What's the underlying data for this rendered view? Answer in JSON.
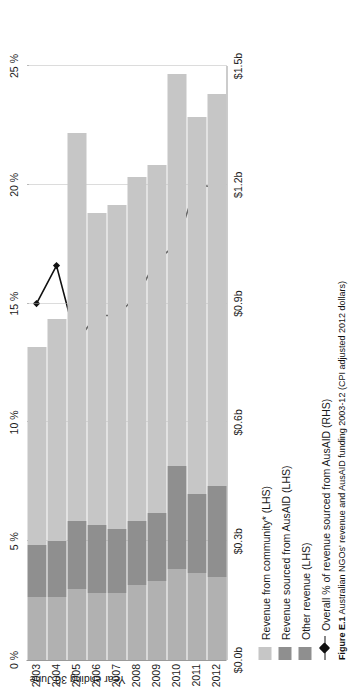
{
  "figure": {
    "caption_label": "Figure E.1",
    "caption_text": "Australian NGOs' revenue and AusAID funding 2003-12 (CPI adjusted 2012 dollars)",
    "x_axis_title": "Year ending 30 June"
  },
  "legend": {
    "items": [
      {
        "key": "community",
        "label": "Revenue from community* (LHS)",
        "marker": "swatch",
        "color": "#c6c6c6"
      },
      {
        "key": "ausaid",
        "label": "Revenue sourced from AusAID (LHS)",
        "marker": "swatch",
        "color": "#8f8f8f"
      },
      {
        "key": "other",
        "label": "Other revenue (LHS)",
        "marker": "swatch",
        "color": "#8f8f8f"
      },
      {
        "key": "pct",
        "label": "Overall % of revenue sourced from AusAID (RHS)",
        "marker": "line-diamond",
        "color": "#111111"
      }
    ]
  },
  "chart_data": {
    "type": "bar",
    "title": "Australian NGOs' revenue and AusAID funding 2003-12 (CPI adjusted 2012 dollars)",
    "xlabel": "Year ending 30 June",
    "ylabel": "",
    "orientation": "vertical-rotated",
    "grid": true,
    "legend_position": "bottom",
    "categories": [
      "2003",
      "2004",
      "2005",
      "2006",
      "2007",
      "2008",
      "2009",
      "2010",
      "2011",
      "2012"
    ],
    "left_axis": {
      "label": "",
      "ticks": [
        "$0.0b",
        "$0.3b",
        "$0.6b",
        "$0.9b",
        "$1.2b",
        "$1.5b"
      ],
      "tick_values": [
        0.0,
        0.3,
        0.6,
        0.9,
        1.2,
        1.5
      ],
      "ylim": [
        0.0,
        1.5
      ],
      "unit": "billion AUD"
    },
    "right_axis": {
      "label": "",
      "ticks": [
        "0 %",
        "5 %",
        "10 %",
        "15 %",
        "20 %",
        "25 %"
      ],
      "tick_values": [
        0,
        5,
        10,
        15,
        20,
        25
      ],
      "ylim": [
        0,
        25
      ],
      "unit": "percent"
    },
    "series": [
      {
        "name": "Other revenue (LHS)",
        "axis": "left",
        "stack": 1,
        "color": "#b1b1b1",
        "values": [
          0.16,
          0.16,
          0.18,
          0.17,
          0.17,
          0.19,
          0.2,
          0.23,
          0.22,
          0.21
        ]
      },
      {
        "name": "Revenue sourced from AusAID (LHS)",
        "axis": "left",
        "stack": 2,
        "color": "#8f8f8f",
        "values": [
          0.13,
          0.14,
          0.17,
          0.17,
          0.16,
          0.16,
          0.17,
          0.26,
          0.2,
          0.23
        ]
      },
      {
        "name": "Revenue from community* (LHS)",
        "axis": "left",
        "stack": 3,
        "color": "#c6c6c6",
        "values": [
          0.5,
          0.56,
          0.98,
          0.79,
          0.82,
          0.87,
          0.88,
          0.99,
          0.95,
          0.99
        ]
      },
      {
        "name": "Overall % of revenue sourced from AusAID (RHS)",
        "axis": "right",
        "type": "line",
        "color": "#111111",
        "values": [
          15.0,
          16.6,
          13.4,
          14.5,
          14.5,
          15.3,
          16.8,
          17.5,
          20.0,
          19.9
        ]
      }
    ],
    "totals": [
      0.79,
      0.86,
      1.33,
      1.13,
      1.15,
      1.22,
      1.25,
      1.48,
      1.37,
      1.43
    ]
  }
}
